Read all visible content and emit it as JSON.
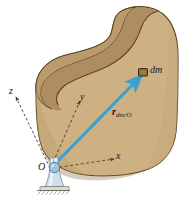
{
  "figure": {
    "background_color": "#ffffff",
    "width": 187,
    "height": 204
  },
  "body_solid": {
    "name": "rigid-body",
    "fill_color": "#cdb183",
    "top_face_color": "#c2a374",
    "inner_shadow_color": "#ab8e60",
    "outline_color": "#5c4424",
    "shape": "c-shaped-kidney-solid"
  },
  "axes": [
    {
      "id": "x",
      "label": "x",
      "style": "dashed",
      "color": "#5a3a18"
    },
    {
      "id": "y",
      "label": "y",
      "style": "dashed",
      "color": "#5a3a18"
    },
    {
      "id": "z",
      "label": "z",
      "style": "dashed",
      "color": "#3a3a3a"
    }
  ],
  "origin": {
    "label": "O",
    "support_type": "ball-and-socket",
    "support_color": "#bcd3e0",
    "base_color": "#d8d8d4"
  },
  "mass_element": {
    "label": "dm",
    "marker_fill": "#8a6a3a",
    "marker_outline": "#3b2a12"
  },
  "vector": {
    "name": "position-vector",
    "symbol": "r",
    "subscript": "dm/O",
    "color": "#3aa0d2",
    "from": "O",
    "to": "dm"
  }
}
